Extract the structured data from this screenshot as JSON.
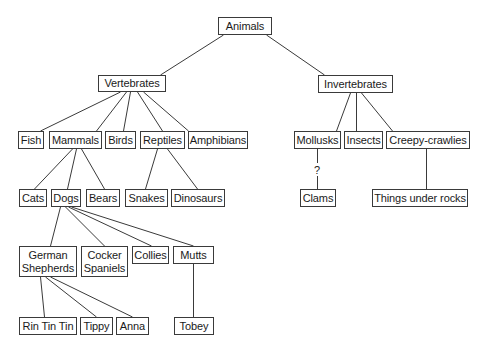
{
  "diagram": {
    "type": "tree",
    "title": "Animals",
    "colors": {
      "background": "#ffffff",
      "stroke": "#3a3a3a",
      "text": "#1a1a1a"
    },
    "nodes": [
      {
        "id": "animals",
        "label": "Animals",
        "x": 218,
        "y": 17,
        "w": 54,
        "h": 18
      },
      {
        "id": "vertebrates",
        "label": "Vertebrates",
        "x": 98,
        "y": 75,
        "w": 68,
        "h": 17
      },
      {
        "id": "invertebrates",
        "label": "Invertebrates",
        "x": 318,
        "y": 75,
        "w": 75,
        "h": 18
      },
      {
        "id": "fish",
        "label": "Fish",
        "x": 18,
        "y": 131,
        "w": 26,
        "h": 18
      },
      {
        "id": "mammals",
        "label": "Mammals",
        "x": 49,
        "y": 131,
        "w": 53,
        "h": 18
      },
      {
        "id": "birds",
        "label": "Birds",
        "x": 105,
        "y": 131,
        "w": 31,
        "h": 18
      },
      {
        "id": "reptiles",
        "label": "Reptiles",
        "x": 140,
        "y": 131,
        "w": 45,
        "h": 18
      },
      {
        "id": "amphibians",
        "label": "Amphibians",
        "x": 188,
        "y": 131,
        "w": 60,
        "h": 18
      },
      {
        "id": "mollusks",
        "label": "Mollusks",
        "x": 294,
        "y": 131,
        "w": 47,
        "h": 18
      },
      {
        "id": "insects",
        "label": "Insects",
        "x": 344,
        "y": 131,
        "w": 39,
        "h": 18
      },
      {
        "id": "creepy_crawlies",
        "label": "Creepy-crawlies",
        "x": 386,
        "y": 131,
        "w": 84,
        "h": 18
      },
      {
        "id": "cats",
        "label": "Cats",
        "x": 19,
        "y": 189,
        "w": 28,
        "h": 18
      },
      {
        "id": "dogs",
        "label": "Dogs",
        "x": 51,
        "y": 189,
        "w": 30,
        "h": 18
      },
      {
        "id": "bears",
        "label": "Bears",
        "x": 86,
        "y": 189,
        "w": 34,
        "h": 18
      },
      {
        "id": "snakes",
        "label": "Snakes",
        "x": 125,
        "y": 189,
        "w": 43,
        "h": 18
      },
      {
        "id": "dinosaurs",
        "label": "Dinosaurs",
        "x": 171,
        "y": 189,
        "w": 54,
        "h": 18
      },
      {
        "id": "clams",
        "label": "Clams",
        "x": 300,
        "y": 189,
        "w": 36,
        "h": 18
      },
      {
        "id": "things_under_rocks",
        "label": "Things under rocks",
        "x": 372,
        "y": 189,
        "w": 96,
        "h": 18
      },
      {
        "id": "german_shepherds",
        "label": "German\nShepherds",
        "x": 19,
        "y": 246,
        "w": 58,
        "h": 31
      },
      {
        "id": "cocker_spaniels",
        "label": "Cocker\nSpaniels",
        "x": 81,
        "y": 246,
        "w": 47,
        "h": 31
      },
      {
        "id": "collies",
        "label": "Collies",
        "x": 132,
        "y": 246,
        "w": 37,
        "h": 18
      },
      {
        "id": "mutts",
        "label": "Mutts",
        "x": 173,
        "y": 246,
        "w": 41,
        "h": 18
      },
      {
        "id": "rin_tin_tin",
        "label": "Rin Tin Tin",
        "x": 19,
        "y": 317,
        "w": 58,
        "h": 18
      },
      {
        "id": "tippy",
        "label": "Tippy",
        "x": 80,
        "y": 317,
        "w": 33,
        "h": 18
      },
      {
        "id": "anna",
        "label": "Anna",
        "x": 116,
        "y": 317,
        "w": 33,
        "h": 18
      },
      {
        "id": "tobey",
        "label": "Tobey",
        "x": 174,
        "y": 317,
        "w": 40,
        "h": 18
      }
    ],
    "edges": [
      {
        "from": "animals",
        "to": "vertebrates",
        "x1": 223,
        "y1": 35,
        "x2": 160,
        "y2": 75
      },
      {
        "from": "animals",
        "to": "invertebrates",
        "x1": 266,
        "y1": 35,
        "x2": 324,
        "y2": 75
      },
      {
        "from": "vertebrates",
        "to": "fish",
        "x1": 120,
        "y1": 92,
        "x2": 40,
        "y2": 131
      },
      {
        "from": "vertebrates",
        "to": "mammals",
        "x1": 126,
        "y1": 92,
        "x2": 96,
        "y2": 131
      },
      {
        "from": "vertebrates",
        "to": "birds",
        "x1": 130,
        "y1": 92,
        "x2": 123,
        "y2": 131
      },
      {
        "from": "vertebrates",
        "to": "reptiles",
        "x1": 137,
        "y1": 92,
        "x2": 162,
        "y2": 131
      },
      {
        "from": "vertebrates",
        "to": "amphibians",
        "x1": 143,
        "y1": 92,
        "x2": 188,
        "y2": 131
      },
      {
        "from": "invertebrates",
        "to": "mollusks",
        "x1": 350,
        "y1": 93,
        "x2": 336,
        "y2": 131
      },
      {
        "from": "invertebrates",
        "to": "insects",
        "x1": 356,
        "y1": 93,
        "x2": 356,
        "y2": 131
      },
      {
        "from": "invertebrates",
        "to": "creepy_crawlies",
        "x1": 361,
        "y1": 93,
        "x2": 392,
        "y2": 131
      },
      {
        "from": "mammals",
        "to": "cats",
        "x1": 72,
        "y1": 149,
        "x2": 34,
        "y2": 189
      },
      {
        "from": "mammals",
        "to": "dogs",
        "x1": 76,
        "y1": 149,
        "x2": 67,
        "y2": 189
      },
      {
        "from": "mammals",
        "to": "bears",
        "x1": 81,
        "y1": 149,
        "x2": 104,
        "y2": 189
      },
      {
        "from": "reptiles",
        "to": "snakes",
        "x1": 157,
        "y1": 149,
        "x2": 145,
        "y2": 189
      },
      {
        "from": "reptiles",
        "to": "dinosaurs",
        "x1": 167,
        "y1": 149,
        "x2": 197,
        "y2": 189
      },
      {
        "from": "mollusks",
        "to": "clams",
        "x1": 317,
        "y1": 149,
        "x2": 317,
        "y2": 163,
        "label": "?"
      },
      {
        "from": "mollusks",
        "to": "clams",
        "x1": 317,
        "y1": 176,
        "x2": 317,
        "y2": 189
      },
      {
        "from": "creepy_crawlies",
        "to": "things_under_rocks",
        "x1": 426,
        "y1": 149,
        "x2": 426,
        "y2": 189
      },
      {
        "from": "dogs",
        "to": "german_shepherds",
        "x1": 60,
        "y1": 207,
        "x2": 50,
        "y2": 246
      },
      {
        "from": "dogs",
        "to": "cocker_spaniels",
        "x1": 65,
        "y1": 207,
        "x2": 104,
        "y2": 246
      },
      {
        "from": "dogs",
        "to": "collies",
        "x1": 68,
        "y1": 207,
        "x2": 151,
        "y2": 246
      },
      {
        "from": "dogs",
        "to": "mutts",
        "x1": 71,
        "y1": 207,
        "x2": 193,
        "y2": 246
      },
      {
        "from": "german_shepherds",
        "to": "rin_tin_tin",
        "x1": 40,
        "y1": 277,
        "x2": 44,
        "y2": 317
      },
      {
        "from": "german_shepherds",
        "to": "tippy",
        "x1": 45,
        "y1": 277,
        "x2": 96,
        "y2": 317
      },
      {
        "from": "german_shepherds",
        "to": "anna",
        "x1": 50,
        "y1": 277,
        "x2": 132,
        "y2": 317
      },
      {
        "from": "mutts",
        "to": "tobey",
        "x1": 193,
        "y1": 264,
        "x2": 193,
        "y2": 317
      }
    ],
    "edge_labels": [
      {
        "text": "?",
        "x": 314,
        "y": 164
      }
    ]
  }
}
